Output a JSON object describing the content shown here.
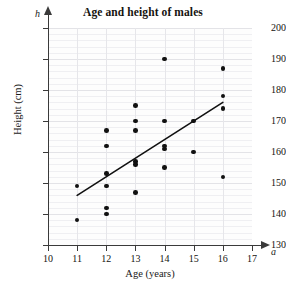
{
  "chart_data": {
    "type": "scatter",
    "title": "Age and height of males",
    "xlabel": "Age (years)",
    "ylabel": "Height (cm)",
    "x_variable": "a",
    "y_variable": "h",
    "xlim": [
      10,
      17
    ],
    "ylim": [
      130,
      200
    ],
    "xticks": [
      10,
      11,
      12,
      13,
      14,
      15,
      16,
      17
    ],
    "yticks": [
      130,
      140,
      150,
      160,
      170,
      180,
      190,
      200
    ],
    "grid": true,
    "minor_gridline_step_y": 2,
    "legend": null,
    "x": [
      11,
      11,
      12,
      12,
      12,
      12,
      12,
      12,
      13,
      13,
      13,
      13,
      13,
      13,
      14,
      14,
      14,
      14,
      14,
      15,
      15,
      16,
      16,
      16,
      16
    ],
    "y": [
      149,
      138,
      167,
      162,
      153,
      149,
      142,
      140,
      175,
      170,
      167,
      157,
      156,
      147,
      190,
      170,
      162,
      161,
      155,
      170,
      160,
      187,
      178,
      174,
      152
    ],
    "points": [
      {
        "a": 11,
        "h": 149
      },
      {
        "a": 11,
        "h": 138
      },
      {
        "a": 12,
        "h": 167
      },
      {
        "a": 12,
        "h": 162
      },
      {
        "a": 12,
        "h": 153
      },
      {
        "a": 12,
        "h": 149
      },
      {
        "a": 12,
        "h": 142
      },
      {
        "a": 12,
        "h": 140
      },
      {
        "a": 13,
        "h": 175
      },
      {
        "a": 13,
        "h": 170
      },
      {
        "a": 13,
        "h": 167
      },
      {
        "a": 13,
        "h": 157
      },
      {
        "a": 13,
        "h": 156
      },
      {
        "a": 13,
        "h": 147
      },
      {
        "a": 14,
        "h": 190
      },
      {
        "a": 14,
        "h": 170
      },
      {
        "a": 14,
        "h": 162
      },
      {
        "a": 14,
        "h": 161
      },
      {
        "a": 14,
        "h": 155
      },
      {
        "a": 15,
        "h": 170
      },
      {
        "a": 15,
        "h": 160
      },
      {
        "a": 16,
        "h": 187
      },
      {
        "a": 16,
        "h": 178
      },
      {
        "a": 16,
        "h": 174
      },
      {
        "a": 16,
        "h": 152
      }
    ],
    "trend_line": {
      "x0": 11,
      "y0": 146,
      "x1": 16,
      "y1": 176
    },
    "colors": {
      "point": "#111111",
      "line": "#111111",
      "axis": "#3a3a3a",
      "grid": "#e6e6ea"
    }
  }
}
